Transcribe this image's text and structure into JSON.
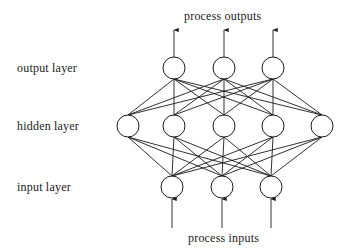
{
  "title_top": "process outputs",
  "title_bottom": "process inputs",
  "layer_labels": {
    "output": "output layer",
    "hidden": "hidden layer",
    "input": "input layer"
  },
  "network": {
    "node_radius": 11,
    "stroke_color": "#1a1a1a",
    "layers": [
      {
        "name": "output",
        "y": 68,
        "x": [
          174,
          224,
          273
        ]
      },
      {
        "name": "hidden",
        "y": 126,
        "x": [
          128,
          174,
          224,
          273,
          322
        ]
      },
      {
        "name": "input",
        "y": 187,
        "x": [
          172,
          222,
          271
        ]
      }
    ],
    "output_arrows": {
      "from_y": 57,
      "to_y": 30
    },
    "input_arrows": {
      "from_y": 228,
      "to_y": 199
    }
  }
}
